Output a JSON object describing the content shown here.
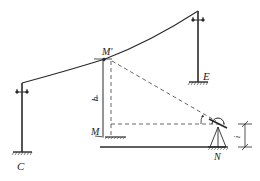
{
  "diagram": {
    "type": "surveying-trigonometric-height",
    "colors": {
      "line": "#2a2a2a",
      "dashed": "#555555",
      "background": "#ffffff"
    },
    "labels": {
      "pole_left": "C",
      "pole_right": "E",
      "cable_point": "M'",
      "ground_point": "M",
      "instrument_station": "N",
      "height": "h",
      "instrument_height": "i"
    },
    "elements": {
      "poles": [
        {
          "name": "C",
          "x": 22,
          "top": 83,
          "bottom": 152
        },
        {
          "name": "E",
          "x": 198,
          "top": 11,
          "bottom": 82
        }
      ],
      "cable": {
        "from": [
          22,
          83
        ],
        "through": [
          105,
          59
        ],
        "to": [
          198,
          11
        ]
      },
      "sight_line": {
        "from": [
          111,
          60
        ],
        "to": [
          217,
          122
        ],
        "style": "dashed"
      },
      "horizontal_line": {
        "y": 124,
        "from_x": 111,
        "to_x": 228,
        "style": "dashed"
      },
      "ground_line": {
        "y": 147,
        "from_x": 100,
        "to_x": 226
      }
    }
  }
}
